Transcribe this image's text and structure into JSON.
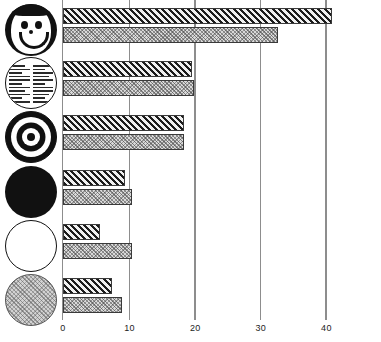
{
  "chart_data": {
    "type": "bar",
    "orientation": "horizontal",
    "title": "",
    "subtitle": "",
    "xlabel": "",
    "ylabel": "",
    "xlim": [
      0,
      44
    ],
    "ylim": null,
    "grid": true,
    "legend_position": "none",
    "xticks": [
      0,
      10,
      20,
      30,
      40
    ],
    "xtick_labels": [
      "0",
      "10",
      "20",
      "30",
      "40"
    ],
    "categories": [
      "smiley-face-circle",
      "printed-text-circle",
      "bullseye-target-circle",
      "solid-black-circle",
      "white-outline-circle",
      "gray-stippled-circle"
    ],
    "series": [
      {
        "name": "hatched",
        "fill": "diagonal-hatch",
        "values": [
          41.0,
          19.7,
          18.5,
          9.4,
          5.6,
          7.4
        ]
      },
      {
        "name": "stippled",
        "fill": "light-stipple",
        "values": [
          32.7,
          20.0,
          18.5,
          10.5,
          10.5,
          9.0
        ]
      }
    ]
  },
  "axis": {
    "tick_labels": [
      "0",
      "10",
      "20",
      "30",
      "40"
    ]
  },
  "icons": [
    {
      "name": "smiley-face-icon",
      "label": "smiley face"
    },
    {
      "name": "printed-text-icon",
      "label": "printed text page"
    },
    {
      "name": "bullseye-target-icon",
      "label": "bullseye target"
    },
    {
      "name": "solid-black-circle-icon",
      "label": "solid black circle"
    },
    {
      "name": "white-circle-icon",
      "label": "white circle"
    },
    {
      "name": "gray-circle-icon",
      "label": "gray stippled circle"
    }
  ],
  "colors": {
    "background": "#ffffff",
    "axis": "#8d8d8d",
    "bar_outline": "#3a3a3a",
    "hatch_dark": "#1c1c1c",
    "stipple_fill": "#d9d9d9",
    "ink": "#111111"
  }
}
